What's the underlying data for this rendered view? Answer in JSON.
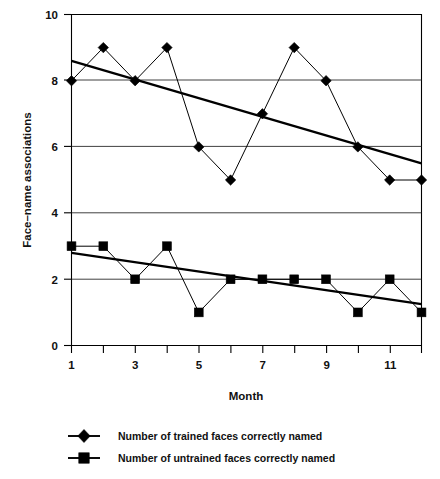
{
  "chart_data": {
    "type": "line",
    "title": "",
    "subtitle": "",
    "xlabel": "Month",
    "ylabel": "Face–name associations",
    "x": [
      1,
      2,
      3,
      4,
      5,
      6,
      7,
      8,
      9,
      10,
      11,
      12
    ],
    "xlim": [
      1,
      12
    ],
    "ylim": [
      0,
      10
    ],
    "x_tick_values": [
      1,
      2,
      3,
      4,
      5,
      6,
      7,
      8,
      9,
      10,
      11,
      12
    ],
    "x_tick_labels": [
      "1",
      "",
      "3",
      "",
      "5",
      "",
      "7",
      "",
      "9",
      "",
      "11",
      ""
    ],
    "y_tick_values": [
      0,
      2,
      4,
      6,
      8,
      10
    ],
    "y_tick_labels": [
      "0",
      "2",
      "4",
      "6",
      "8",
      "10"
    ],
    "grid": "horizontal",
    "legend_position": "bottom",
    "series": [
      {
        "name": "Number of trained faces correctly named",
        "marker": "diamond",
        "values": [
          8,
          9,
          8,
          9,
          6,
          5,
          7,
          9,
          8,
          6,
          5,
          5
        ],
        "trendline": {
          "start": 8.6,
          "end": 5.5
        }
      },
      {
        "name": "Number of untrained faces correctly named",
        "marker": "square",
        "values": [
          3,
          3,
          2,
          3,
          1,
          2,
          2,
          2,
          2,
          1,
          2,
          1
        ],
        "trendline": {
          "start": 2.8,
          "end": 1.25
        }
      }
    ],
    "colors": {
      "series_trained": "#000000",
      "series_untrained": "#000000",
      "axis": "#000000",
      "grid": "#2b2b2b",
      "background": "#ffffff"
    }
  },
  "axes": {
    "y_label": "Face–name associations",
    "x_label": "Month",
    "y_ticks": [
      "10",
      "8",
      "6",
      "4",
      "2",
      "0"
    ],
    "x_ticks": [
      "1",
      "3",
      "5",
      "7",
      "9",
      "11"
    ]
  },
  "legend": {
    "entries": [
      {
        "marker": "diamond-marker",
        "label": "Number of trained faces correctly named"
      },
      {
        "marker": "square-marker",
        "label": "Number of untrained faces correctly named"
      }
    ]
  }
}
